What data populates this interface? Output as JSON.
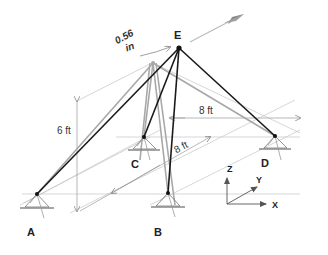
{
  "figure": {
    "type": "3D truss / tripod structure with support nodes",
    "nodes": {
      "A": {
        "label": "A",
        "x": 37,
        "y": 194,
        "label_x": 27,
        "label_y": 236
      },
      "B": {
        "label": "B",
        "x": 168,
        "y": 193,
        "label_x": 154,
        "label_y": 236
      },
      "C": {
        "label": "C",
        "x": 144,
        "y": 137,
        "label_x": 131,
        "label_y": 168
      },
      "D": {
        "label": "D",
        "x": 275,
        "y": 136,
        "label_x": 261,
        "label_y": 167
      },
      "E": {
        "label": "E",
        "x": 179,
        "y": 48,
        "label_x": 174,
        "label_y": 39
      }
    },
    "displaced_apex": {
      "x": 153,
      "y": 63
    },
    "members_loaded": [
      [
        "E",
        "A"
      ],
      [
        "E",
        "B"
      ],
      [
        "E",
        "C"
      ],
      [
        "E",
        "D"
      ]
    ],
    "members_original": [
      [
        "E0",
        "A"
      ],
      [
        "E0",
        "B"
      ],
      [
        "E0",
        "C"
      ],
      [
        "E0",
        "D"
      ]
    ],
    "dimensions": {
      "height": "6 ft",
      "width_x": "8 ft",
      "depth_y": "8 ft",
      "displacement_value": "0.56",
      "displacement_unit": "in"
    },
    "axes": {
      "z_label": "Z",
      "y_label": "Y",
      "x_label": "X"
    },
    "colors": {
      "member": "#1a1a1a",
      "original_member": "#a8a8a8",
      "construction_line": "#b0b0b0",
      "load_arrow": "#9a9a9a",
      "text": "#222222"
    }
  }
}
